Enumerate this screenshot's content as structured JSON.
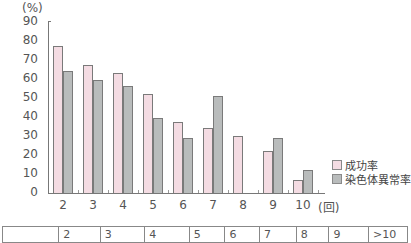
{
  "chart_data": {
    "type": "bar",
    "title": "",
    "ylabel": "(%)",
    "xlabel": "(回)",
    "ylim": [
      0,
      90
    ],
    "yticks": [
      0,
      10,
      20,
      30,
      40,
      50,
      60,
      70,
      80,
      90
    ],
    "categories": [
      "2",
      "3",
      "4",
      "5",
      "6",
      "7",
      "8",
      "9",
      "10"
    ],
    "series": [
      {
        "name": "成功率",
        "color": "#f4dce3",
        "values": [
          77,
          67,
          63,
          52,
          37,
          34,
          30,
          22,
          7
        ]
      },
      {
        "name": "染色体異常率",
        "color": "#b9bcbc",
        "values": [
          64,
          59,
          56,
          39,
          29,
          51,
          0,
          29,
          12
        ]
      }
    ],
    "grid": false,
    "legend_position": "right-bottom"
  },
  "axis": {
    "y_unit": "(%)",
    "x_unit": "(回)",
    "y_ticks": [
      "90",
      "80",
      "70",
      "60",
      "50",
      "40",
      "30",
      "20",
      "10",
      "0"
    ],
    "x_ticks": [
      "2",
      "3",
      "4",
      "5",
      "6",
      "7",
      "8",
      "9",
      "10"
    ]
  },
  "legend": {
    "success_rate": "成功率",
    "chromosome_abnormality_rate": "染色体異常率"
  },
  "table": {
    "header": [
      "",
      "2",
      "3",
      "4",
      "5",
      "6",
      "7",
      "8",
      "9",
      ">10"
    ]
  }
}
